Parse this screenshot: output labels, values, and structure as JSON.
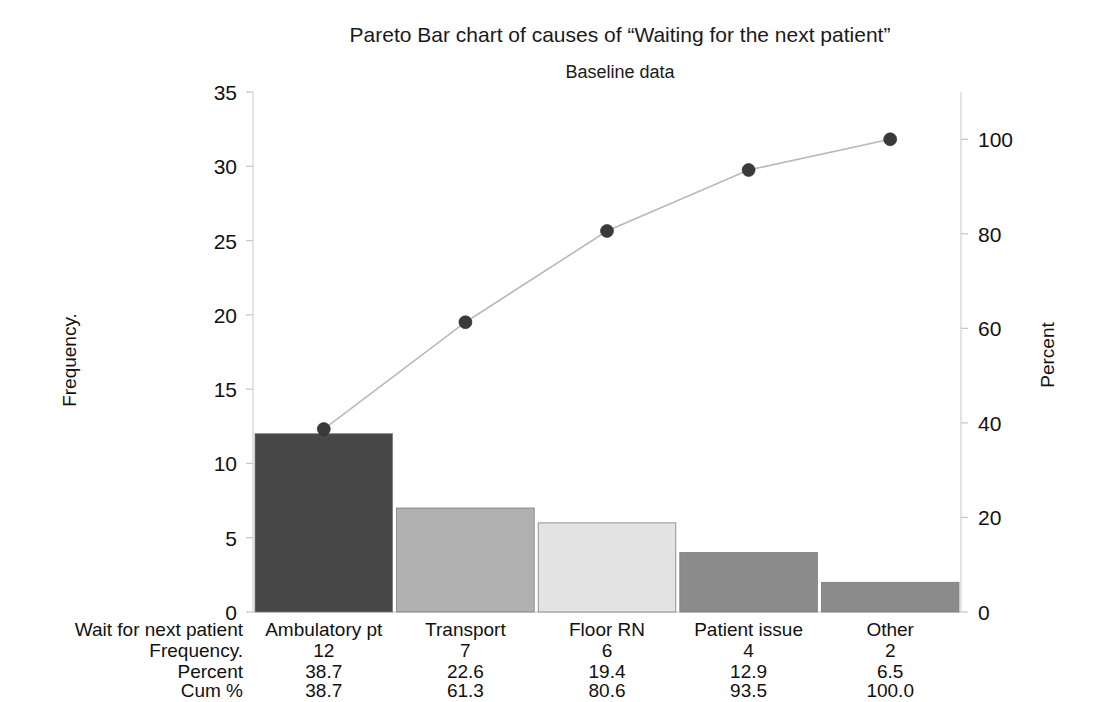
{
  "titles": {
    "main": "Pareto Bar chart of  causes of “Waiting for the next patient”",
    "sub": "Baseline data"
  },
  "axes": {
    "left_title": "Frequency.",
    "right_title": "Percent",
    "left_ticks": [
      "0",
      "5",
      "10",
      "15",
      "20",
      "25",
      "30",
      "35"
    ],
    "right_ticks": [
      "0",
      "20",
      "40",
      "60",
      "80",
      "100"
    ]
  },
  "table": {
    "row_labels": [
      "Wait for next patient",
      "Frequency.",
      "Percent",
      "Cum %"
    ],
    "categories": [
      "Ambulatory pt",
      "Transport",
      "Floor RN",
      "Patient issue",
      "Other"
    ],
    "frequency": [
      "12",
      "7",
      "6",
      "4",
      "2"
    ],
    "percent": [
      "38.7",
      "22.6",
      "19.4",
      "12.9",
      "6.5"
    ],
    "cum_percent": [
      "38.7",
      "61.3",
      "80.6",
      "93.5",
      "100.0"
    ]
  },
  "colors": {
    "bar1": "#474747",
    "bar2": "#b0b0b0",
    "bar3": "#e3e3e3",
    "bar4": "#8b8b8b",
    "bar5": "#8b8b8b",
    "line": "#b9b9b9",
    "marker": "#3a3a3a",
    "axis": "#d8d8d8",
    "text": "#111111"
  },
  "chart_data": {
    "type": "bar",
    "title": "Pareto Bar chart of  causes of “Waiting for the next patient”",
    "subtitle": "Baseline data",
    "xlabel": "Wait for next patient",
    "ylabel": "Frequency.",
    "y2label": "Percent",
    "categories": [
      "Ambulatory pt",
      "Transport",
      "Floor RN",
      "Patient issue",
      "Other"
    ],
    "values": [
      12,
      7,
      6,
      4,
      2
    ],
    "percent": [
      38.7,
      22.6,
      19.4,
      12.9,
      6.5
    ],
    "cumulative_percent": [
      38.7,
      61.3,
      80.6,
      93.5,
      100.0
    ],
    "ylim": [
      0,
      35
    ],
    "yticks": [
      0,
      5,
      10,
      15,
      20,
      25,
      30,
      35
    ],
    "y2lim": [
      0,
      110
    ],
    "y2ticks": [
      0,
      20,
      40,
      60,
      80,
      100
    ],
    "grid": false,
    "legend": "none",
    "bar_colors": [
      "#474747",
      "#b0b0b0",
      "#e3e3e3",
      "#8b8b8b",
      "#8b8b8b"
    ],
    "total_frequency": 31
  }
}
